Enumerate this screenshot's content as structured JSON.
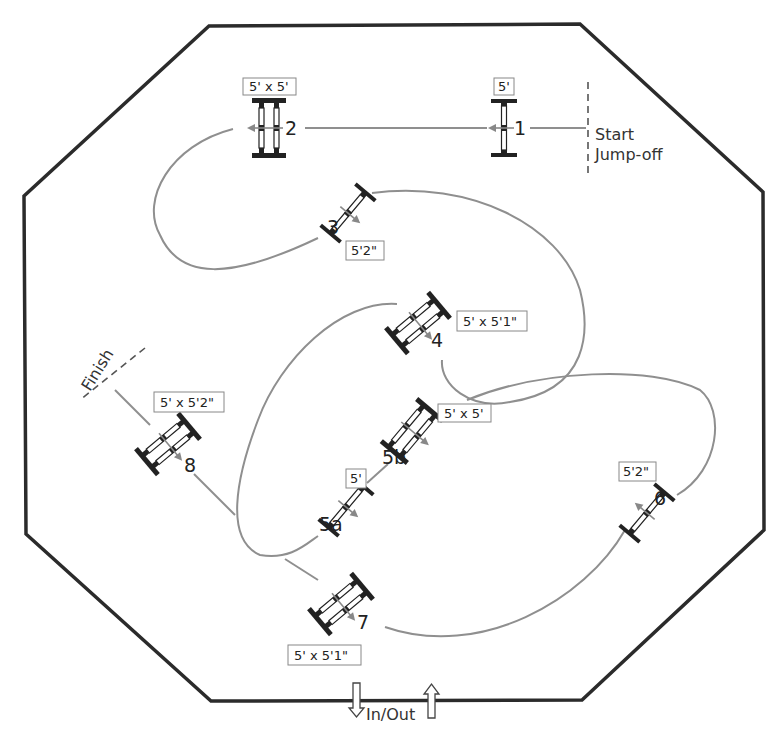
{
  "arena": {
    "shape": "octagon",
    "points": "209,26 580,24 763,192 764,530 582,700 211,701 26,534 24,196",
    "stroke": "#2b2b2b"
  },
  "start": {
    "line1": "Start",
    "line2": "Jump-off"
  },
  "finish": {
    "label": "Finish"
  },
  "gate": {
    "label": "In/Out"
  },
  "path_color": "#8f8f8f",
  "fences": [
    {
      "id": "1",
      "number": "1",
      "height": "5'",
      "type": "vertical"
    },
    {
      "id": "2",
      "number": "2",
      "height": "5' x 5'",
      "type": "oxer"
    },
    {
      "id": "3",
      "number": "3",
      "height": "5'2\"",
      "type": "vertical"
    },
    {
      "id": "4",
      "number": "4",
      "height": "5' x 5'1\"",
      "type": "oxer"
    },
    {
      "id": "5a",
      "number": "5a",
      "height": "5'",
      "type": "vertical"
    },
    {
      "id": "5b",
      "number": "5b",
      "height": "5' x 5'",
      "type": "oxer"
    },
    {
      "id": "6",
      "number": "6",
      "height": "5'2\"",
      "type": "vertical"
    },
    {
      "id": "7",
      "number": "7",
      "height": "5' x 5'1\"",
      "type": "oxer"
    },
    {
      "id": "8",
      "number": "8",
      "height": "5' x 5'2\"",
      "type": "oxer"
    }
  ]
}
